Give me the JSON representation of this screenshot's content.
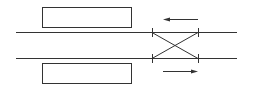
{
  "diagram": {
    "type": "railway-track-layout",
    "background": "#ffffff",
    "stroke_color": "#333333",
    "platforms": [
      {
        "name": "upper-platform",
        "x": 42,
        "y": 7,
        "w": 89,
        "h": 20
      },
      {
        "name": "lower-platform",
        "x": 42,
        "y": 63,
        "w": 89,
        "h": 20
      }
    ],
    "tracks": [
      {
        "name": "upper-track",
        "x1": 16,
        "x2": 237,
        "y": 32
      },
      {
        "name": "lower-track",
        "x1": 16,
        "x2": 237,
        "y": 58
      }
    ],
    "crossover": {
      "type": "scissors",
      "x_left": 152,
      "x_right": 198
    },
    "arrows": [
      {
        "name": "upper-direction",
        "direction": "left",
        "x_from": 198,
        "x_to": 163,
        "y": 19
      },
      {
        "name": "lower-direction",
        "direction": "right",
        "x_from": 163,
        "x_to": 198,
        "y": 71
      }
    ]
  }
}
